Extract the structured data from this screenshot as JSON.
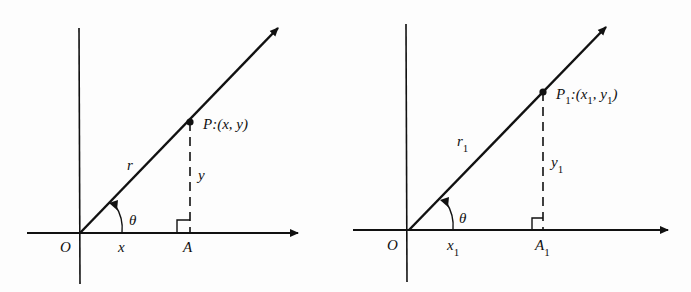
{
  "figures": [
    {
      "name": "general",
      "point_label": "P:(x, y)",
      "radius_label": "r",
      "y_label": "y",
      "x_label": "x",
      "angle_label": "θ",
      "origin_label": "O",
      "foot_label": "A"
    },
    {
      "name": "subscripted",
      "point_label": "P",
      "point_sub": "1",
      "point_coords_prefix": ":(x",
      "point_coords_x_sub": "1",
      "point_coords_mid": ", y",
      "point_coords_y_sub": "1",
      "point_coords_suffix": ")",
      "radius_label": "r",
      "radius_sub": "1",
      "y_label": "y",
      "y_sub": "1",
      "x_label": "x",
      "x_sub": "1",
      "angle_label": "θ",
      "origin_label": "O",
      "foot_label": "A",
      "foot_sub": "1"
    }
  ],
  "colors": {
    "ink": "#111111",
    "background": "#fdfdfd"
  }
}
